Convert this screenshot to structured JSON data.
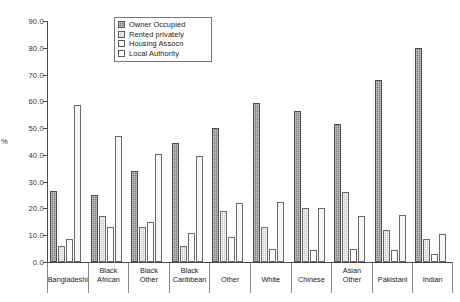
{
  "chart_data": {
    "type": "bar",
    "title": "",
    "xlabel": "",
    "ylabel": "%",
    "ylim": [
      0,
      90
    ],
    "ytick_step": 10,
    "ytick_labels": [
      "0.0",
      "10.0",
      "20.0",
      "30.0",
      "40.0",
      "50.0",
      "60.0",
      "70.0",
      "80.0",
      "90.0"
    ],
    "grid": false,
    "legend_position": "top-center",
    "categories": [
      "Bangladeshi",
      "Black African",
      "Black Other",
      "Black Caribbean",
      "Other",
      "White",
      "Chinese",
      "Asian Other",
      "Pakistani",
      "Indian"
    ],
    "category_lines": [
      [
        "Bangladeshi"
      ],
      [
        "Black",
        "African"
      ],
      [
        "Black",
        "Other"
      ],
      [
        "Black",
        "Caribbean"
      ],
      [
        "Other"
      ],
      [
        "White"
      ],
      [
        "Chinese"
      ],
      [
        "Asian",
        "Other"
      ],
      [
        "Pakistani"
      ],
      [
        "Indian"
      ]
    ],
    "series": [
      {
        "name": "Owner Occupied",
        "key": "owner",
        "color": "#808080",
        "values": [
          26.5,
          25.0,
          34.0,
          44.5,
          50.0,
          59.5,
          56.5,
          51.5,
          68.0,
          80.0
        ]
      },
      {
        "name": "Rented privately",
        "key": "rented",
        "color": "#c9c9c9",
        "values": [
          6.0,
          17.0,
          13.0,
          6.0,
          19.0,
          13.0,
          20.0,
          26.0,
          12.0,
          8.5
        ]
      },
      {
        "name": "Housing Assocn",
        "key": "housing",
        "color": "#fdfdfd",
        "values": [
          8.5,
          13.0,
          15.0,
          11.0,
          9.5,
          5.0,
          4.5,
          5.0,
          4.5,
          3.0
        ]
      },
      {
        "name": "Local Authority",
        "key": "local",
        "color": "#f7f7f5",
        "values": [
          58.5,
          47.0,
          40.5,
          39.5,
          22.0,
          22.5,
          20.0,
          17.0,
          17.5,
          10.5
        ]
      }
    ]
  },
  "legend": {
    "items": [
      {
        "label": "Owner Occupied",
        "key": "owner"
      },
      {
        "label": "Rented privately",
        "key": "rented"
      },
      {
        "label": "Housing Assocn",
        "key": "housing"
      },
      {
        "label": "Local Authority",
        "key": "local"
      }
    ]
  },
  "caption": ""
}
